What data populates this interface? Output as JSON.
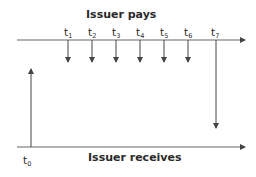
{
  "diagram": {
    "top_label": "Issuer pays",
    "bottom_label": "Issuer receives",
    "payment_points": [
      {
        "base": "t",
        "sub": "1"
      },
      {
        "base": "t",
        "sub": "2"
      },
      {
        "base": "t",
        "sub": "3"
      },
      {
        "base": "t",
        "sub": "4"
      },
      {
        "base": "t",
        "sub": "5"
      },
      {
        "base": "t",
        "sub": "6"
      },
      {
        "base": "t",
        "sub": "7"
      }
    ],
    "receipt_point": {
      "base": "t",
      "sub": "0"
    },
    "line_color": "#555555"
  }
}
